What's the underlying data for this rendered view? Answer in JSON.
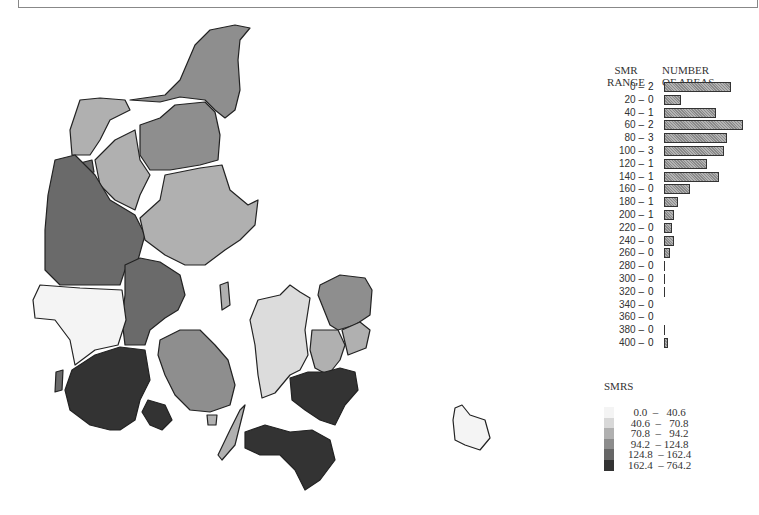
{
  "header": {
    "title": "DENMARK: APPENDIX: MORTALITY TABLES 3-97"
  },
  "map": {
    "title": "Denmark SMR choropleth map",
    "regions": [
      {
        "name": "north-jutland-tip",
        "class": 3
      },
      {
        "name": "thy",
        "class": 2
      },
      {
        "name": "mors",
        "class": 4
      },
      {
        "name": "himmerland",
        "class": 3
      },
      {
        "name": "salling",
        "class": 2
      },
      {
        "name": "west-jutland",
        "class": 4
      },
      {
        "name": "east-jutland",
        "class": 2
      },
      {
        "name": "central-jutland",
        "class": 4
      },
      {
        "name": "ribe",
        "class": 0
      },
      {
        "name": "south-jutland",
        "class": 5
      },
      {
        "name": "als",
        "class": 5
      },
      {
        "name": "funen",
        "class": 3
      },
      {
        "name": "langeland",
        "class": 2
      },
      {
        "name": "samso",
        "class": 2
      },
      {
        "name": "west-zealand",
        "class": 1
      },
      {
        "name": "north-zealand",
        "class": 3
      },
      {
        "name": "copenhagen-county",
        "class": 2
      },
      {
        "name": "copenhagen",
        "class": 2
      },
      {
        "name": "storstrom",
        "class": 5
      },
      {
        "name": "lolland-falster",
        "class": 5
      },
      {
        "name": "bornholm",
        "class": 0
      }
    ]
  },
  "chart_data": {
    "type": "bar",
    "xlabel": "SMR RANGE",
    "ylabel": "NUMBER OF AREAS",
    "categories": [
      "0 –",
      "20 –",
      "40 –",
      "60 –",
      "80 –",
      "100 –",
      "120 –",
      "140 –",
      "160 –",
      "180 –",
      "200 –",
      "220 –",
      "240 –",
      "260 –",
      "280 –",
      "300 –",
      "320 –",
      "340 –",
      "360 –",
      "380 –",
      "400 –"
    ],
    "counts": [
      "2",
      "0",
      "1",
      "2",
      "3",
      "3",
      "1",
      "1",
      "0",
      "1",
      "1",
      "0",
      "0",
      "0",
      "0",
      "0",
      "0",
      "0",
      "0",
      "0",
      "0"
    ],
    "bar_widths_px": [
      67,
      17,
      52,
      79,
      63,
      60,
      43,
      55,
      26,
      14,
      10,
      8,
      10,
      6,
      2,
      2,
      1,
      0,
      0,
      1,
      4
    ]
  },
  "histogram": {
    "col1_line1": "SMR",
    "col1_line2": "RANGE",
    "col2_line1": "NUMBER",
    "col2_line2": "OF AREAS"
  },
  "legend": {
    "title": "SMRS",
    "items": [
      {
        "range": "  0.0  –   40.6",
        "color": "#f4f4f4"
      },
      {
        "range": " 40.6  –   70.8",
        "color": "#d8d8d8"
      },
      {
        "range": " 70.8  –   94.2",
        "color": "#b0b0b0"
      },
      {
        "range": " 94.2  – 124.8",
        "color": "#8c8c8c"
      },
      {
        "range": "124.8  – 162.4",
        "color": "#666666"
      },
      {
        "range": "162.4  – 764.2",
        "color": "#333333"
      }
    ]
  },
  "colors": {
    "class0": "#f4f4f4",
    "class1": "#dcdcdc",
    "class2": "#b0b0b0",
    "class3": "#8e8e8e",
    "class4": "#6a6a6a",
    "class5": "#333333"
  }
}
